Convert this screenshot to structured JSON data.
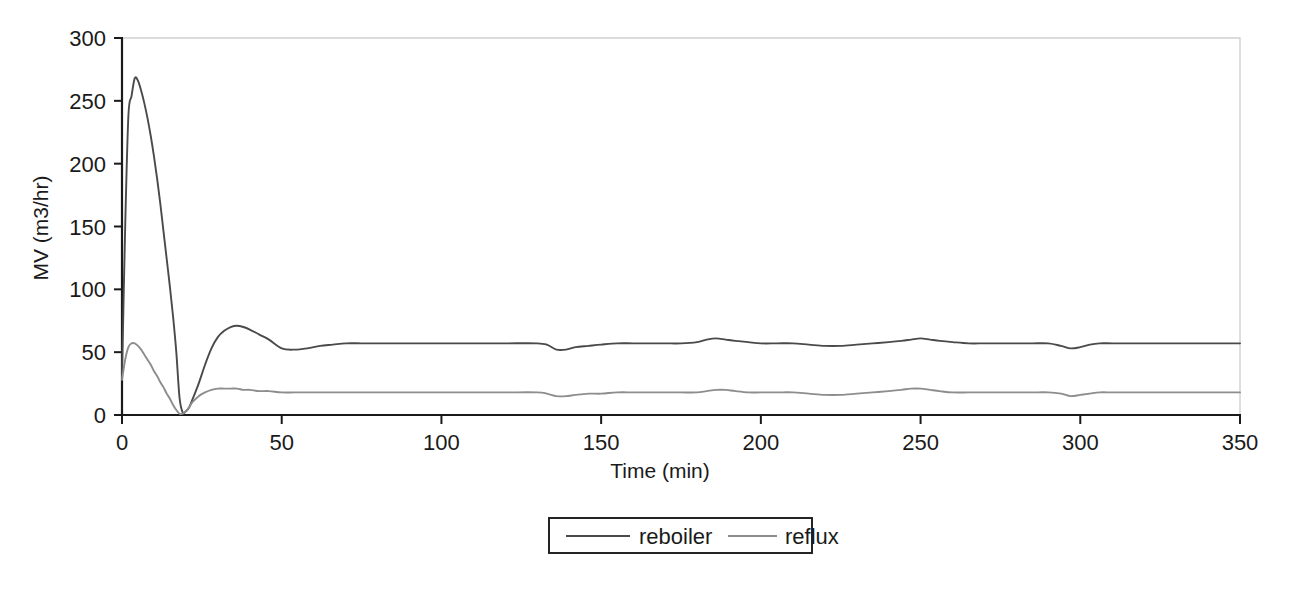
{
  "chart_data": {
    "type": "line",
    "title": "",
    "xlabel": "Time (min)",
    "ylabel": "MV (m3/hr)",
    "xlim": [
      0,
      350
    ],
    "ylim": [
      0,
      300
    ],
    "xticks": [
      0,
      50,
      100,
      150,
      200,
      250,
      300,
      350
    ],
    "xticklabels": [
      "0",
      "50",
      "100",
      "150",
      "200",
      "250",
      "300",
      "350"
    ],
    "yticks": [
      0,
      50,
      100,
      150,
      200,
      250,
      300
    ],
    "yticklabels": [
      "0",
      "50",
      "100",
      "150",
      "200",
      "250",
      "300"
    ],
    "grid": false,
    "legend_position": "below-center",
    "series": [
      {
        "name": "reboiler",
        "color": "#4a4a4a",
        "x": [
          0,
          1,
          2,
          3,
          4,
          5,
          6,
          7,
          8,
          9,
          10,
          11,
          12,
          13,
          14,
          15,
          16,
          17,
          18,
          19,
          20,
          21,
          22,
          24,
          26,
          28,
          30,
          32,
          34,
          36,
          38,
          40,
          43,
          46,
          50,
          54,
          58,
          62,
          66,
          70,
          75,
          80,
          90,
          100,
          110,
          120,
          130,
          133,
          136,
          139,
          142,
          146,
          150,
          155,
          160,
          165,
          170,
          175,
          180,
          183,
          186,
          189,
          192,
          196,
          200,
          205,
          210,
          215,
          220,
          225,
          230,
          235,
          240,
          244,
          247,
          250,
          253,
          256,
          260,
          265,
          270,
          275,
          280,
          285,
          290,
          294,
          297,
          300,
          303,
          306,
          310,
          315,
          320,
          325,
          330,
          335,
          340,
          345,
          350
        ],
        "y": [
          30,
          150,
          238,
          254,
          268,
          266,
          258,
          248,
          236,
          222,
          206,
          188,
          168,
          146,
          124,
          102,
          78,
          50,
          14,
          2,
          3,
          6,
          12,
          25,
          40,
          53,
          62,
          67,
          70,
          71,
          70,
          68,
          64,
          60,
          53,
          52,
          53,
          55,
          56,
          57,
          57,
          57,
          57,
          57,
          57,
          57,
          57,
          56,
          52,
          52,
          54,
          55,
          56,
          57,
          57,
          57,
          57,
          57,
          58,
          60,
          61,
          60,
          59,
          58,
          57,
          57,
          57,
          56,
          55,
          55,
          56,
          57,
          58,
          59,
          60,
          61,
          60,
          59,
          58,
          57,
          57,
          57,
          57,
          57,
          57,
          55,
          53,
          54,
          56,
          57,
          57,
          57,
          57,
          57,
          57,
          57,
          57,
          57,
          57
        ]
      },
      {
        "name": "reflux",
        "color": "#8d8d8d",
        "x": [
          0,
          1,
          2,
          3,
          4,
          5,
          6,
          7,
          8,
          9,
          10,
          11,
          12,
          13,
          14,
          15,
          16,
          17,
          18,
          19,
          20,
          21,
          22,
          24,
          26,
          28,
          30,
          32,
          34,
          36,
          38,
          40,
          43,
          46,
          50,
          54,
          58,
          62,
          66,
          70,
          75,
          80,
          90,
          100,
          110,
          120,
          130,
          133,
          136,
          139,
          142,
          146,
          150,
          155,
          160,
          165,
          170,
          175,
          180,
          183,
          186,
          189,
          192,
          196,
          200,
          205,
          210,
          215,
          220,
          225,
          230,
          235,
          240,
          244,
          247,
          250,
          253,
          256,
          260,
          265,
          270,
          275,
          280,
          285,
          290,
          294,
          297,
          300,
          303,
          306,
          310,
          315,
          320,
          325,
          330,
          335,
          340,
          345,
          350
        ],
        "y": [
          28,
          44,
          54,
          57,
          57,
          55,
          52,
          48,
          44,
          40,
          35,
          31,
          26,
          22,
          17,
          13,
          8,
          4,
          1,
          1,
          3,
          6,
          10,
          15,
          18,
          20,
          21,
          21,
          21,
          21,
          20,
          20,
          19,
          19,
          18,
          18,
          18,
          18,
          18,
          18,
          18,
          18,
          18,
          18,
          18,
          18,
          18,
          17,
          15,
          15,
          16,
          17,
          17,
          18,
          18,
          18,
          18,
          18,
          18,
          19,
          20,
          20,
          19,
          18,
          18,
          18,
          18,
          17,
          16,
          16,
          17,
          18,
          19,
          20,
          21,
          21,
          20,
          19,
          18,
          18,
          18,
          18,
          18,
          18,
          18,
          17,
          15,
          16,
          17,
          18,
          18,
          18,
          18,
          18,
          18,
          18,
          18,
          18,
          18
        ]
      }
    ],
    "legend": [
      {
        "label": "reboiler",
        "color": "#4a4a4a"
      },
      {
        "label": "reflux",
        "color": "#8d8d8d"
      }
    ],
    "colors": {
      "reboiler": "#4a4a4a",
      "reflux": "#8d8d8d",
      "axis": "#1a1a1a",
      "frame": "#d0d0d0",
      "background": "#ffffff"
    }
  }
}
